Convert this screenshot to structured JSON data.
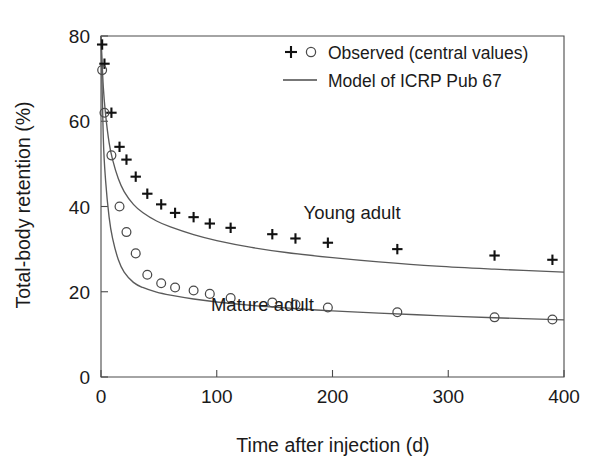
{
  "chart_data": {
    "type": "scatter",
    "title": "",
    "xlabel": "Time after injection (d)",
    "ylabel": "Total-body retention (%)",
    "xlim": [
      0,
      400
    ],
    "ylim": [
      0,
      80
    ],
    "xticks": [
      0,
      100,
      200,
      300,
      400
    ],
    "yticks": [
      0,
      20,
      40,
      60,
      80
    ],
    "grid": false,
    "legend_position": "top-right",
    "legend": [
      {
        "label": "Observed (central values)",
        "marker": "plus-and-circle"
      },
      {
        "label": "Model of ICRP Pub 67",
        "marker": "line"
      }
    ],
    "annotations": [
      {
        "text": "Young adult",
        "x": 175,
        "y": 37
      },
      {
        "text": "Mature adult",
        "x": 95,
        "y": 15.5
      }
    ],
    "series": [
      {
        "name": "Young adult",
        "marker": "plus",
        "observed": {
          "x": [
            1,
            3,
            9,
            16,
            22,
            30,
            40,
            52,
            64,
            80,
            94,
            112,
            148,
            168,
            196,
            256,
            340,
            390
          ],
          "y": [
            78.0,
            73.5,
            62.0,
            54.0,
            51.0,
            47.0,
            43.0,
            40.5,
            38.5,
            37.5,
            36.0,
            35.0,
            33.5,
            32.5,
            31.5,
            30.0,
            28.5,
            27.5
          ]
        },
        "model": {
          "x": [
            0,
            2,
            4,
            7,
            10,
            15,
            20,
            28,
            36,
            48,
            60,
            80,
            100,
            130,
            160,
            200,
            240,
            290,
            340,
            400
          ],
          "y": [
            80.0,
            68.0,
            61.5,
            55.0,
            51.0,
            46.5,
            43.5,
            40.5,
            38.6,
            36.6,
            35.2,
            33.4,
            32.0,
            30.4,
            29.2,
            28.0,
            27.0,
            26.0,
            25.3,
            24.6
          ]
        }
      },
      {
        "name": "Mature adult",
        "marker": "circle",
        "observed": {
          "x": [
            1,
            3,
            9,
            16,
            22,
            30,
            40,
            52,
            64,
            80,
            94,
            112,
            148,
            168,
            196,
            256,
            340,
            390
          ],
          "y": [
            72.0,
            62.0,
            52.0,
            40.0,
            34.0,
            29.0,
            24.0,
            22.0,
            21.0,
            20.3,
            19.5,
            18.5,
            17.5,
            17.0,
            16.3,
            15.2,
            14.0,
            13.5
          ]
        },
        "model": {
          "x": [
            0,
            2,
            4,
            7,
            10,
            15,
            20,
            28,
            36,
            48,
            60,
            80,
            100,
            130,
            160,
            200,
            240,
            290,
            340,
            400
          ],
          "y": [
            80.0,
            56.0,
            46.0,
            37.5,
            32.5,
            27.5,
            24.6,
            22.2,
            21.0,
            19.9,
            19.2,
            18.3,
            17.6,
            16.8,
            16.2,
            15.5,
            15.0,
            14.4,
            13.9,
            13.4
          ]
        }
      }
    ]
  },
  "axes": {
    "y_title": "Total-body retention (%)",
    "x_title": "Time after injection (d)",
    "y_tick_labels": [
      "0",
      "20",
      "40",
      "60",
      "80"
    ],
    "x_tick_labels": [
      "0",
      "100",
      "200",
      "300",
      "400"
    ]
  },
  "legend": {
    "observed_label": "Observed (central values)",
    "model_label": "Model of ICRP Pub 67"
  },
  "annotations": {
    "young_adult": "Young adult",
    "mature_adult": "Mature adult"
  },
  "colors": {
    "axis": "#4a4a4a",
    "curve": "#5a5a5a",
    "marker": "#111111",
    "background": "#ffffff"
  }
}
